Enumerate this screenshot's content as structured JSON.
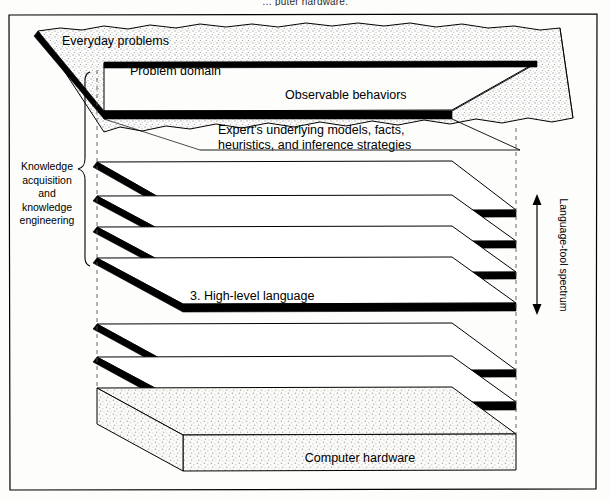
{
  "figure": {
    "top_caption": "… puter hardware."
  },
  "frame": {
    "border_color": "#000000",
    "background": "#fdfdfc"
  },
  "top_slab": {
    "labels": [
      {
        "id": "everyday-problems",
        "text": "Everyday problems",
        "x": 62,
        "y": 41
      },
      {
        "id": "problem-domain",
        "text": "Problem domain",
        "x": 130,
        "y": 72
      },
      {
        "id": "observable-behaviors",
        "text": "Observable behaviors",
        "x": 285,
        "y": 96
      },
      {
        "id": "experts-models-line1",
        "text": "Expert's underlying models, facts,",
        "x": 218,
        "y": 131
      },
      {
        "id": "experts-models-line2",
        "text": "heuristics, and inference strategies",
        "x": 218,
        "y": 146
      }
    ],
    "texture": "stipple"
  },
  "layers": [
    {
      "n": "6.",
      "label": "6. Knowledge system",
      "x": 190,
      "y": 204
    },
    {
      "n": "5.",
      "label": "5. Tool",
      "x": 190,
      "y": 238
    },
    {
      "n": "4.",
      "label": "4. Environment",
      "x": 190,
      "y": 269
    },
    {
      "n": "3.",
      "label": "3. High-level language",
      "x": 190,
      "y": 300
    },
    {
      "n": "2.",
      "label": "2. Operating system",
      "x": 190,
      "y": 364
    },
    {
      "n": "1.",
      "label": "1. Machine language",
      "x": 190,
      "y": 396
    }
  ],
  "hardware": {
    "label": "Computer hardware",
    "x": 360,
    "y": 459,
    "texture": "stipple"
  },
  "left_annotation": {
    "lines": [
      "Knowledge",
      "acquisition",
      "and",
      "knowledge",
      "engineering"
    ],
    "x": 47,
    "y_start": 166,
    "line_height": 13.5,
    "brace": {
      "top": 72,
      "bottom": 266,
      "x": 86
    }
  },
  "right_annotation": {
    "text": "Language-tool spectrum",
    "x": 560,
    "y": 255,
    "arrow": {
      "x": 537,
      "top": 196,
      "bottom": 313,
      "double_headed": true
    }
  },
  "colors": {
    "ink": "#000000",
    "stipple": "#b9b9b3",
    "dash": "#555555",
    "paper": "#fdfdfc"
  }
}
